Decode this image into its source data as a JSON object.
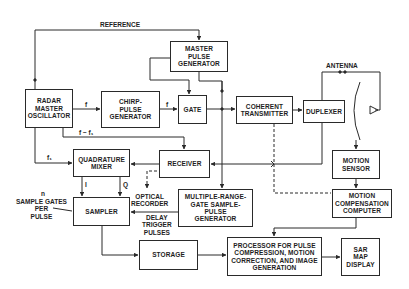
{
  "diagram": {
    "blocks": {
      "master_pulse_generator": "MASTER\nPULSE\nGENERATOR",
      "radar_master_oscillator": "RADAR\nMASTER\nOSCILLATOR",
      "chirp_pulse_generator": "CHIRP-\nPULSE\nGENERATOR",
      "gate": "GATE",
      "coherent_transmitter": "COHERENT\nTRANSMITTER",
      "duplexer": "DUPLEXER",
      "receiver": "RECEIVER",
      "quadrature_mixer": "QUADRATURE\nMIXER",
      "sampler": "SAMPLER",
      "multiple_range_gate": "MULTIPLE-RANGE-\nGATE SAMPLE-\nPULSE\nGENERATOR",
      "motion_sensor": "MOTION\nSENSOR",
      "motion_compensation_computer": "MOTION\nCOMPENSATION\nCOMPUTER",
      "storage": "STORAGE",
      "processor": "PROCESSOR FOR PULSE\nCOMPRESSION, MOTION\nCORRECTION, AND IMAGE\nGENERATION",
      "sar_map_display": "SAR\nMAP\nDISPLAY"
    },
    "labels": {
      "reference": "REFERENCE",
      "antenna": "ANTENNA",
      "f_to_chirp": "f",
      "f_to_gate": "f",
      "f_minus_f1": "f − f₁",
      "f1": "f₁",
      "i_channel": "I",
      "q_channel": "Q",
      "optical_recorder": "OPTICAL\nRECORDER",
      "delay_trigger_pulses": "DELAY\nTRIGGER\nPULSES",
      "n": "n",
      "sample_gates_per_pulse": "SAMPLE GATES\nPER\nPULSE"
    },
    "colors": {
      "line": "#2a2a2a",
      "text": "#1e1e1e",
      "background": "#ffffff"
    }
  }
}
